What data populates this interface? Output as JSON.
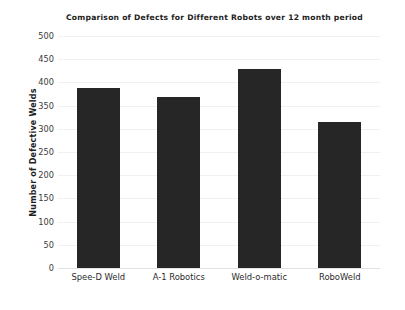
{
  "chart_data": {
    "type": "bar",
    "title": "Comparison of Defects for Different Robots over 12 month period",
    "xlabel": "",
    "ylabel": "Number of Defective Welds",
    "categories": [
      "Spee-D Weld",
      "A-1 Robotics",
      "Weld-o-matic",
      "RoboWeld"
    ],
    "values": [
      387,
      369,
      429,
      315
    ],
    "series": [
      {
        "name": "Number of Defective Welds",
        "values": [
          387,
          369,
          429,
          315
        ]
      }
    ],
    "ylim": [
      0,
      500
    ],
    "ytick_step": 50,
    "ytick_labels": [
      "500",
      "450",
      "400",
      "350",
      "300",
      "250",
      "200",
      "150",
      "100",
      "50",
      "0"
    ],
    "ytick_values": [
      500,
      450,
      400,
      350,
      300,
      250,
      200,
      150,
      100,
      50,
      0
    ],
    "grid": true,
    "grid_axis": "y",
    "legend": false,
    "legend_position": "none",
    "bar_color": "#262626",
    "grid_color": "#f0f0f0",
    "background_color": "#ffffff",
    "text_color": "#1d1d1d"
  }
}
